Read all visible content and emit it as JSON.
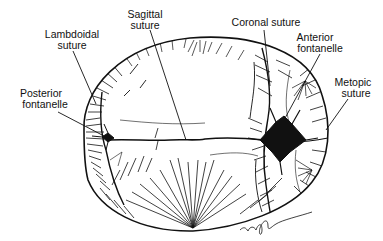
{
  "figure": {
    "labels": {
      "sagittal": [
        "Sagittal",
        "suture"
      ],
      "lambdoidal": [
        "Lambdoidal",
        "suture"
      ],
      "coronal": [
        "Coronal suture"
      ],
      "anterior": [
        "Anterior",
        "fontanelle"
      ],
      "metopic": [
        "Metopic",
        "suture"
      ],
      "posterior": [
        "Posterior",
        "fontanelle"
      ]
    },
    "signature": "artist signature"
  },
  "colors": {
    "ink": "#111111",
    "background": "#ffffff"
  }
}
